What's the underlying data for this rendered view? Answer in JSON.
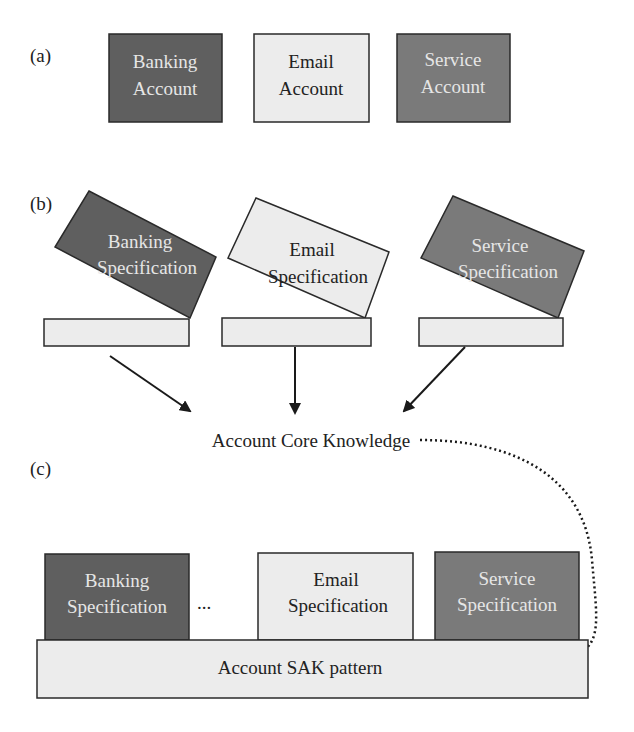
{
  "colors": {
    "dark": "#5f5f5f",
    "medium": "#7a7a7a",
    "light": "#ececec",
    "stroke": "#2a2a2a",
    "text_light": "#e6e6e6",
    "text_dark": "#222222"
  },
  "panel_a": {
    "label": "(a)",
    "boxes": [
      {
        "line1": "Banking",
        "line2": "Account"
      },
      {
        "line1": "Email",
        "line2": "Account"
      },
      {
        "line1": "Service",
        "line2": "Account"
      }
    ]
  },
  "panel_b": {
    "label": "(b)",
    "boxes": [
      {
        "line1": "Banking",
        "line2": "Specification"
      },
      {
        "line1": "Email",
        "line2": "Specification"
      },
      {
        "line1": "Service",
        "line2": "Specification"
      }
    ],
    "target": "Account Core Knowledge"
  },
  "panel_c": {
    "label": "(c)",
    "boxes": [
      {
        "line1": "Banking",
        "line2": "Specification"
      },
      {
        "line1": "Email",
        "line2": "Specification"
      },
      {
        "line1": "Service",
        "line2": "Specification"
      }
    ],
    "ellipsis": "...",
    "base": "Account SAK pattern"
  }
}
